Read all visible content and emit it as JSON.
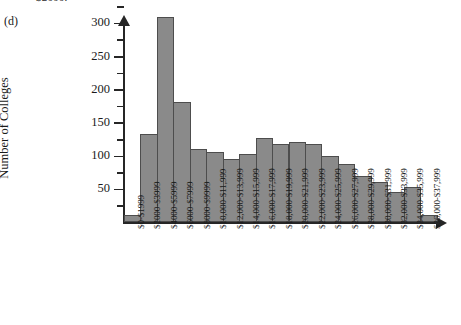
{
  "figure": {
    "part_label": "(d)",
    "top_caption": "$2000.",
    "y_axis_title": "Number of Colleges"
  },
  "chart_data": {
    "type": "bar",
    "title": "",
    "subtitle": "",
    "xlabel": "",
    "ylabel": "Number of Colleges",
    "ylim": [
      0,
      330
    ],
    "ytick_labels": [
      "50",
      "100",
      "150",
      "200",
      "250",
      "300"
    ],
    "ytick_values": [
      50,
      100,
      150,
      200,
      250,
      300
    ],
    "yminor_step": 25,
    "grid": false,
    "legend": false,
    "bar_color": "#8a8a8a",
    "bar_edge_color": "#4d4d4d",
    "categories": [
      "$0-$1999",
      "$2000-$3999",
      "$4000-$5999",
      "$6000-$7999",
      "$8000-$9999",
      "$10,000-$11,999",
      "$12,000-$13,999",
      "$14,000-$15,999",
      "$16,000-$17,999",
      "$18,000-$19,999",
      "$20,000-$21,999",
      "$22,000-$23,999",
      "$24,000-$25,999",
      "$26,000-$27,999",
      "$28,000-$29,999",
      "$30,000-$31,999",
      "$32,000-$33,999",
      "$34,000-$35,999",
      "$36,000-$37,999"
    ],
    "values": [
      10,
      133,
      308,
      181,
      110,
      105,
      95,
      102,
      127,
      118,
      120,
      117,
      100,
      88,
      70,
      60,
      45,
      52,
      10
    ]
  }
}
